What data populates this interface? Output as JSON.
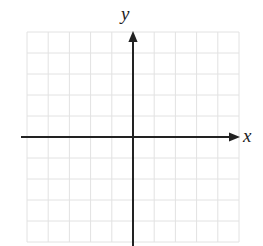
{
  "figure": {
    "kind": "cartesian-coordinate-grid",
    "width": 263,
    "height": 246,
    "background_color": "#ffffff"
  },
  "grid": {
    "columns": 10,
    "rows": 10,
    "left": 27,
    "top": 32,
    "right": 239,
    "bottom": 242,
    "cell_width": 21.2,
    "cell_height": 21,
    "line_color": "#e2e2e2",
    "line_width": 1
  },
  "axes": {
    "color": "#222222",
    "line_width": 2,
    "origin": {
      "x": 133,
      "y": 137
    },
    "x_axis": {
      "label": "x",
      "start_x": 21,
      "end_x": 240,
      "y": 137,
      "arrow": "right"
    },
    "y_axis": {
      "label": "y",
      "x": 133,
      "start_y": 246,
      "end_y": 31,
      "arrow": "up"
    }
  },
  "chart_data": {
    "type": "scatter",
    "title": "",
    "xlabel": "x",
    "ylabel": "y",
    "x": [],
    "y": [],
    "series": [],
    "xlim": [
      -5,
      5
    ],
    "ylim": [
      -5,
      5
    ],
    "xticks": [
      -5,
      -4,
      -3,
      -2,
      -1,
      0,
      1,
      2,
      3,
      4,
      5
    ],
    "yticks": [
      -5,
      -4,
      -3,
      -2,
      -1,
      0,
      1,
      2,
      3,
      4,
      5
    ],
    "xtick_labels": [
      "",
      "",
      "",
      "",
      "",
      "",
      "",
      "",
      "",
      "",
      ""
    ],
    "ytick_labels": [
      "",
      "",
      "",
      "",
      "",
      "",
      "",
      "",
      "",
      "",
      ""
    ],
    "grid": true,
    "legend": null,
    "annotations": []
  }
}
